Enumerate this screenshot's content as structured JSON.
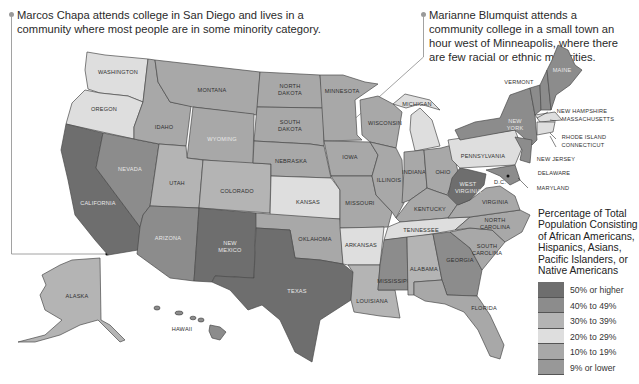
{
  "callouts": [
    {
      "text": "Marcos Chapa attends college in San Diego and lives in a community where most people are in some minority category."
    },
    {
      "text": "Marianne Blumquist attends a community college in a small town an hour west of Minneapolis, where there are few racial or ethnic minorities."
    }
  ],
  "legend": {
    "title": "Percentage of Total Population Consisting of African Americans, Hispanics, Asians, Pacific Islanders, or Native Americans",
    "items": [
      {
        "label": "50% or higher",
        "color": "#6e6e6e"
      },
      {
        "label": "40% to 49%",
        "color": "#8c8c8c"
      },
      {
        "label": "30% to 39%",
        "color": "#b4b4b4"
      },
      {
        "label": "20% to 29%",
        "color": "#dedede"
      },
      {
        "label": "10% to 19%",
        "color": "#a8a8a8"
      },
      {
        "label": "9% or lower",
        "color": "#989898"
      }
    ]
  },
  "states": {
    "washington": "WASHINGTON",
    "oregon": "OREGON",
    "california": "CALIFORNIA",
    "nevada": "NEVADA",
    "idaho": "IDAHO",
    "montana": "MONTANA",
    "wyoming": "WYOMING",
    "utah": "UTAH",
    "colorado": "COLORADO",
    "arizona": "ARIZONA",
    "new_mexico_1": "NEW",
    "new_mexico_2": "MEXICO",
    "texas": "TEXAS",
    "north_dakota_1": "NORTH",
    "north_dakota_2": "DAKOTA",
    "south_dakota_1": "SOUTH",
    "south_dakota_2": "DAKOTA",
    "nebraska": "NEBRASKA",
    "kansas": "KANSAS",
    "oklahoma": "OKLAHOMA",
    "minnesota": "MINNESOTA",
    "iowa": "IOWA",
    "missouri": "MISSOURI",
    "arkansas": "ARKANSAS",
    "louisiana": "LOUISIANA",
    "wisconsin": "WISCONSIN",
    "illinois": "ILLINOIS",
    "michigan": "MICHIGAN",
    "indiana": "INDIANA",
    "ohio": "OHIO",
    "kentucky": "KENTUCKY",
    "tennessee": "TENNESSEE",
    "mississippi": "MISSISSIPPI",
    "alabama": "ALABAMA",
    "georgia": "GEORGIA",
    "florida": "FLORIDA",
    "south_carolina_1": "SOUTH",
    "south_carolina_2": "CAROLINA",
    "north_carolina_1": "NORTH",
    "north_carolina_2": "CAROLINA",
    "virginia": "VIRGINIA",
    "west_virginia_1": "WEST",
    "west_virginia_2": "VIRGINIA",
    "dc": "D.C.",
    "pennsylvania": "PENNSYLVANIA",
    "new_york_1": "NEW",
    "new_york_2": "YORK",
    "vermont": "VERMONT",
    "maine": "MAINE",
    "new_hampshire": "NEW HAMPSHIRE",
    "massachusetts": "MASSACHUSETTS",
    "rhode_island": "RHODE ISLAND",
    "connecticut": "CONNECTICUT",
    "new_jersey": "NEW JERSEY",
    "delaware": "DELAWARE",
    "maryland": "MARYLAND",
    "alaska": "ALASKA",
    "hawaii": "HAWAII"
  }
}
